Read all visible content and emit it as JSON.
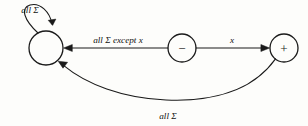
{
  "diagram": {
    "type": "state-transition-diagram",
    "background_color": "#fdfdfb",
    "ink_color": "#1a1a1a",
    "states": [
      {
        "id": "start",
        "symbol": "",
        "cx": 46,
        "cy": 48,
        "r": 17
      },
      {
        "id": "minus",
        "symbol": "−",
        "cx": 182,
        "cy": 48,
        "r": 14
      },
      {
        "id": "plus",
        "symbol": "+",
        "cx": 284,
        "cy": 48,
        "r": 14
      }
    ],
    "edges": [
      {
        "id": "self-loop",
        "from": "start",
        "to": "start",
        "label": "all Σ",
        "label_x": 30,
        "label_y": 13
      },
      {
        "id": "minus-to-start",
        "from": "minus",
        "to": "start",
        "label": "all Σ except x",
        "label_x": 118,
        "label_y": 43
      },
      {
        "id": "minus-to-plus",
        "from": "minus",
        "to": "plus",
        "label": "x",
        "label_x": 232,
        "label_y": 43
      },
      {
        "id": "plus-to-start",
        "from": "plus",
        "to": "start",
        "label": "all Σ",
        "label_x": 168,
        "label_y": 119
      }
    ]
  }
}
